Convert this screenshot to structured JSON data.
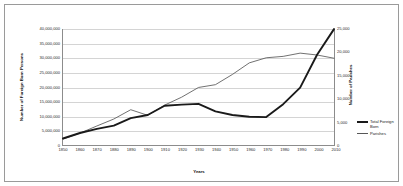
{
  "chart_data": {
    "type": "line",
    "title": "",
    "xlabel": "Years",
    "ylabel": "Number of Foreign Born Persons",
    "y2label": "Number of Parishes",
    "grid": true,
    "legend_position": "right",
    "x": [
      1850,
      1860,
      1870,
      1880,
      1890,
      1900,
      1910,
      1920,
      1930,
      1940,
      1950,
      1960,
      1970,
      1980,
      1990,
      2000,
      2010
    ],
    "xtick_labels": [
      "1850",
      "1860",
      "1870",
      "1880",
      "1890",
      "1900",
      "1910",
      "1920",
      "1930",
      "1940",
      "1950",
      "1960",
      "1970",
      "1980",
      "1990",
      "2000",
      "2010"
    ],
    "xlim": [
      1850,
      2010
    ],
    "ylim": [
      0,
      40000000
    ],
    "ytick_labels": [
      "0",
      "5,000,000",
      "10,000,000",
      "15,000,000",
      "20,000,000",
      "25,000,000",
      "30,000,000",
      "35,000,000",
      "40,000,000"
    ],
    "ytick_values": [
      0,
      5000000,
      10000000,
      15000000,
      20000000,
      25000000,
      30000000,
      35000000,
      40000000
    ],
    "y2lim": [
      0,
      25000
    ],
    "y2tick_labels": [
      "0",
      "5,000",
      "10,000",
      "15,000",
      "20,000",
      "25,000"
    ],
    "y2tick_values": [
      0,
      5000,
      10000,
      15000,
      20000,
      25000
    ],
    "series": [
      {
        "name": "Total Foreign Born",
        "legend_label": "Total Foreign Born",
        "axis": "left",
        "color": "#1a1a1a",
        "line_width": "thick",
        "values": [
          2240000,
          4140000,
          5570000,
          6680000,
          9250000,
          10340000,
          13520000,
          13920000,
          14200000,
          11590000,
          10350000,
          9740000,
          9620000,
          14080000,
          19770000,
          31100000,
          39960000
        ]
      },
      {
        "name": "Parishes",
        "legend_label": "Parishes",
        "axis": "right",
        "color": "#575757",
        "line_width": "thin",
        "values": [
          1300,
          2550,
          4100,
          5600,
          7600,
          6400,
          8600,
          10300,
          12400,
          13000,
          15200,
          17700,
          18800,
          19100,
          19800,
          19400,
          18700
        ]
      }
    ]
  },
  "axes": {
    "left_title": "Number of Foreign Born Persons",
    "right_title": "Number of Parishes",
    "x_title": "Years"
  },
  "legend": {
    "entries": [
      {
        "label": "Total Foreign Born",
        "style": "thick"
      },
      {
        "label": "Parishes",
        "style": "thin"
      }
    ]
  }
}
